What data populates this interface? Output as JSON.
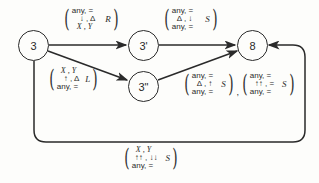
{
  "diagram": {
    "type": "state-transition-graph",
    "nodes": [
      {
        "id": "n3",
        "label": "3"
      },
      {
        "id": "n3p",
        "label": "3'"
      },
      {
        "id": "n3pp",
        "label": "3\""
      },
      {
        "id": "n8",
        "label": "8"
      }
    ],
    "edges": [
      {
        "from": "3",
        "to": "3'",
        "labels": [
          {
            "rows": [
              "any, =",
              "↓ , Δ",
              "X , Y"
            ],
            "dir": "R"
          }
        ]
      },
      {
        "from": "3'",
        "to": "8",
        "labels": [
          {
            "rows": [
              "any, =",
              "Δ , ↓",
              "any, ="
            ],
            "dir": "S"
          }
        ]
      },
      {
        "from": "3",
        "to": "3\"",
        "labels": [
          {
            "rows": [
              "X , Y",
              "↑ , Δ",
              "any, ="
            ],
            "dir": "L"
          }
        ]
      },
      {
        "from": "3\"",
        "to": "8",
        "labels": [
          {
            "rows": [
              "any, =",
              "Δ , ↑",
              "any, ="
            ],
            "dir": "S"
          },
          {
            "rows": [
              "any, =",
              "↑↑ , =",
              "any, ="
            ],
            "dir": "S"
          }
        ],
        "separator": ","
      },
      {
        "from": "3",
        "to": "8",
        "route": "loop-bottom",
        "labels": [
          {
            "rows": [
              "X , Y",
              "↑↑ , ↓↓",
              "any, ="
            ],
            "dir": "S"
          }
        ]
      }
    ]
  }
}
